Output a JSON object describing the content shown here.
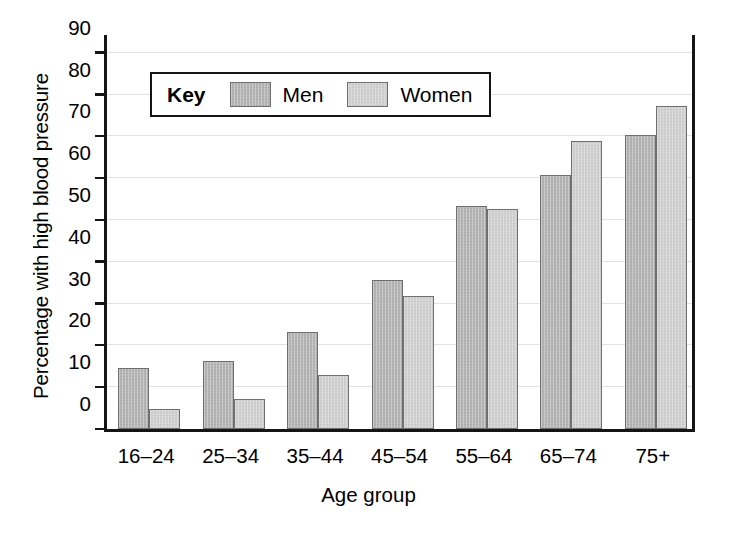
{
  "chart_data": {
    "type": "bar",
    "title": "",
    "xlabel": "Age group",
    "ylabel": "Percentage with high blood pressure",
    "categories": [
      "16–24",
      "25–34",
      "35–44",
      "45–54",
      "55–64",
      "65–74",
      "75+"
    ],
    "series": [
      {
        "name": "Men",
        "values": [
          14.5,
          16.2,
          23.1,
          35.6,
          53.4,
          60.7,
          70.3
        ],
        "color": "#b4b4b4"
      },
      {
        "name": "Women",
        "values": [
          4.9,
          7.3,
          13.0,
          31.8,
          52.6,
          69.0,
          77.2
        ],
        "color": "#d0d0d0"
      }
    ],
    "ylim": [
      0,
      95
    ],
    "yticks": [
      0,
      10,
      20,
      30,
      40,
      50,
      60,
      70,
      80,
      90
    ],
    "ytick_labels": [
      "0",
      "10",
      "20",
      "30",
      "40",
      "50",
      "60",
      "70",
      "80",
      "90"
    ],
    "grid": true,
    "grid_axis": "y",
    "legend_position": "upper left",
    "legend_title": "Key",
    "bar_edge_color": "#6f6f6f",
    "axis_color": "#151515",
    "grid_color": "#e2e2e2",
    "background": "#ffffff"
  },
  "legend": {
    "title": "Key",
    "entries": [
      {
        "label": "Men",
        "swatch": "men"
      },
      {
        "label": "Women",
        "swatch": "women"
      }
    ]
  }
}
